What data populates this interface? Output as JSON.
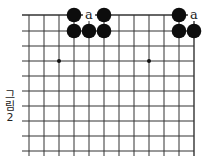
{
  "figure": {
    "caption_lines": [
      "그",
      "림",
      "2"
    ],
    "grid": {
      "columns_x": [
        29,
        44,
        59,
        74,
        89,
        104,
        119,
        134,
        149,
        164,
        179,
        194
      ],
      "rows_y": [
        15,
        31,
        46,
        61,
        76,
        91,
        106,
        121,
        136,
        151
      ],
      "line_color": "#333333"
    },
    "star_points": [
      {
        "x": 59,
        "y": 61
      },
      {
        "x": 149,
        "y": 61
      }
    ],
    "black_stones": [
      {
        "x": 74,
        "y": 15
      },
      {
        "x": 104,
        "y": 15
      },
      {
        "x": 179,
        "y": 15
      },
      {
        "x": 74,
        "y": 31
      },
      {
        "x": 89,
        "y": 31
      },
      {
        "x": 104,
        "y": 31
      },
      {
        "x": 179,
        "y": 31
      },
      {
        "x": 194,
        "y": 31
      }
    ],
    "markers": [
      {
        "x": 89,
        "y": 15,
        "text": "a"
      },
      {
        "x": 194,
        "y": 15,
        "text": "a"
      }
    ]
  }
}
